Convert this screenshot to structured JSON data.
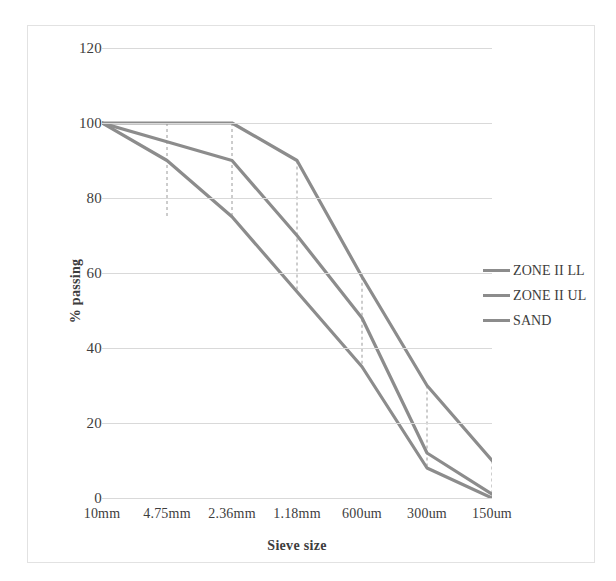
{
  "chart_data": {
    "type": "line",
    "title": "",
    "xlabel": "Sieve size",
    "ylabel": "% passing",
    "categories": [
      "10mm",
      "4.75mm",
      "2.36mm",
      "1.18mm",
      "600um",
      "300um",
      "150um"
    ],
    "ylim": [
      0,
      120
    ],
    "yticks": [
      0,
      20,
      40,
      60,
      80,
      100,
      120
    ],
    "ytick_labels": [
      "0",
      "20",
      "40",
      "60",
      "80",
      "100",
      "120"
    ],
    "grid": true,
    "legend_position": "right",
    "series": [
      {
        "name": "ZONE II LL",
        "color": "#8c8c8c",
        "values": [
          100,
          90,
          75,
          55,
          35,
          8,
          0
        ]
      },
      {
        "name": "ZONE II UL",
        "color": "#8c8c8c",
        "values": [
          100,
          100,
          100,
          90,
          59,
          30,
          10
        ]
      },
      {
        "name": "SAND",
        "color": "#8c8c8c",
        "values": [
          100,
          95,
          90,
          70,
          48,
          12,
          1
        ]
      }
    ],
    "dashed_connectors": [
      {
        "category": "4.75mm",
        "from": 100,
        "to": 75
      },
      {
        "category": "2.36mm",
        "from": 100,
        "to": 75
      },
      {
        "category": "1.18mm",
        "from": 90,
        "to": 55
      },
      {
        "category": "600um",
        "from": 59,
        "to": 35
      },
      {
        "category": "300um",
        "from": 30,
        "to": 8
      },
      {
        "category": "150um",
        "from": 10,
        "to": 0
      }
    ]
  },
  "legend": {
    "items": [
      {
        "label": "ZONE II LL",
        "color": "#8c8c8c"
      },
      {
        "label": "ZONE II UL",
        "color": "#8c8c8c"
      },
      {
        "label": "SAND",
        "color": "#8c8c8c"
      }
    ]
  },
  "axes": {
    "y_title": "% passing",
    "x_title": "Sieve size"
  }
}
